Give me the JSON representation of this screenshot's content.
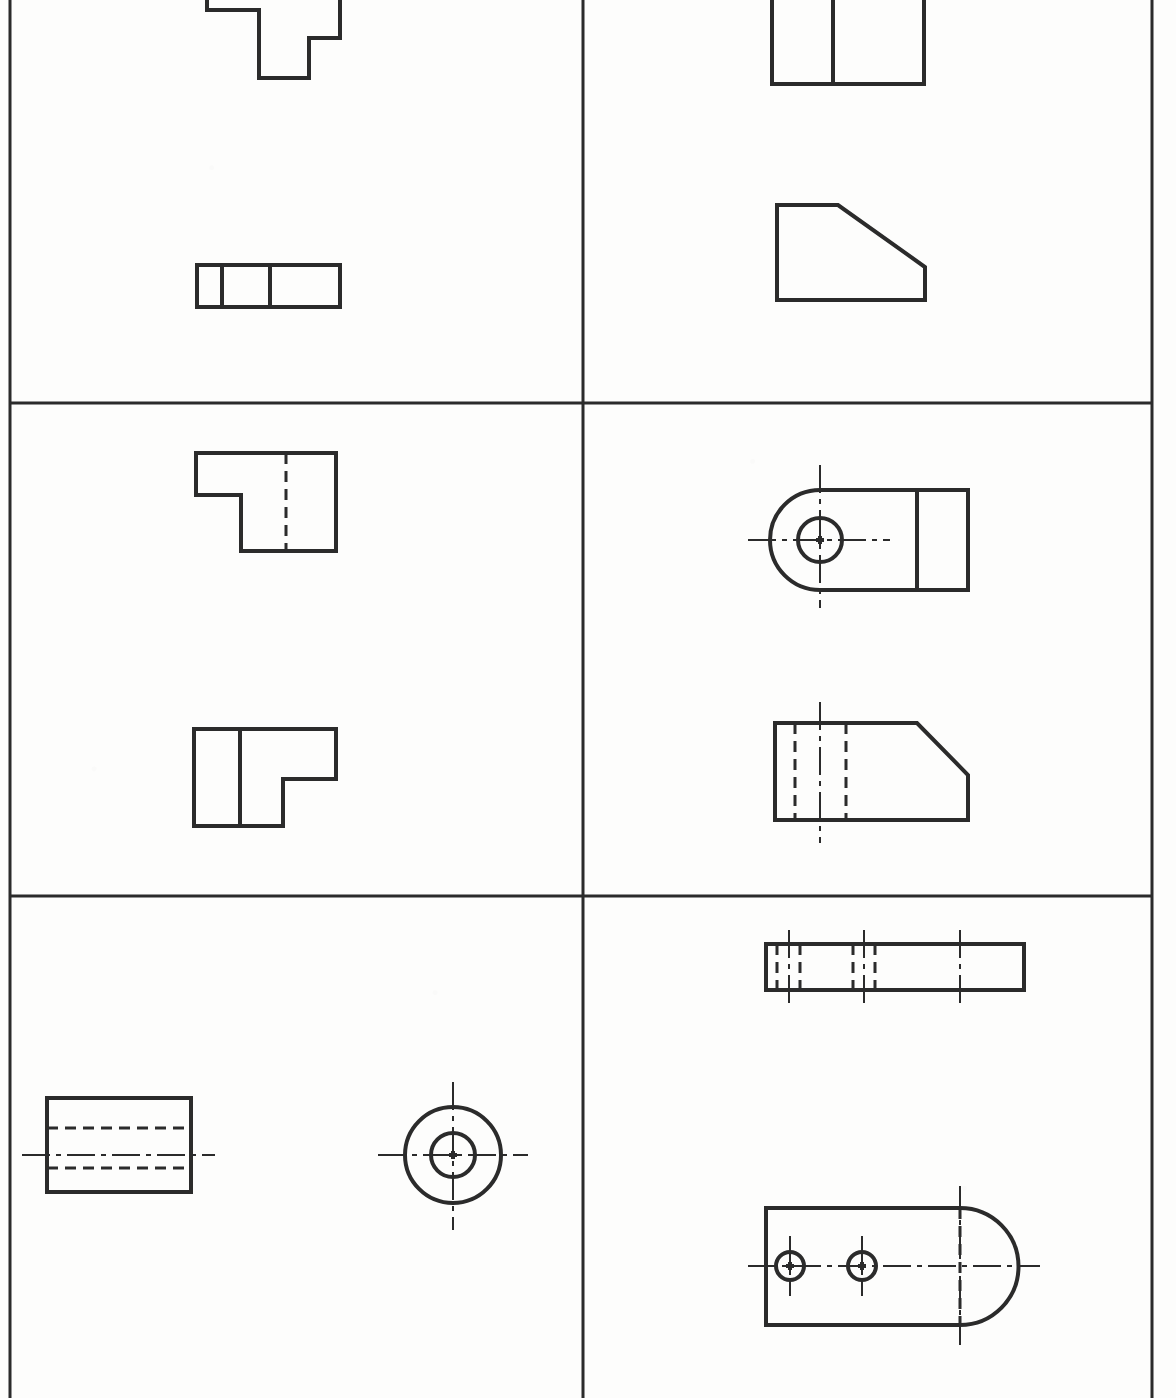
{
  "document": {
    "kind": "engineering-drawing-worksheet",
    "title": "Orthographic Projection Exercises",
    "page_width": 1176,
    "page_height": 1398,
    "background_color": "#fdfdfc",
    "line_color": "#2b2b2b",
    "border": {
      "left_x": 10,
      "right_x": 1152,
      "visible_edges": [
        "left",
        "right"
      ],
      "stroke_width": 3
    },
    "grid": {
      "columns": 2,
      "rows": 3,
      "vertical_divider_x": 583,
      "horizontal_divider_y": [
        403,
        896
      ],
      "stroke_width": 3
    },
    "line_styles": {
      "visible": {
        "name": "visible-object-line",
        "dash": "none",
        "width": 4
      },
      "hidden": {
        "name": "hidden-dashed-line",
        "dash": "11,7",
        "width": 3
      },
      "center": {
        "name": "center-line",
        "dash": "28,6,5,6",
        "width": 2
      }
    }
  },
  "cells": [
    {
      "id": "cell-top-left",
      "name": "exercise-1",
      "row": 1,
      "column": 1,
      "figures": [
        {
          "id": "fig-1a",
          "name": "stepped-t-block-front-view",
          "view": "front",
          "shape": "polyline-outline",
          "clipped_at_page_top": true,
          "points": "207,-40 207,10 259,10 259,78 309,78 309,38 340,38 340,-40",
          "style": "visible"
        },
        {
          "id": "fig-1b",
          "name": "three-compartment-rectangle-top-view",
          "view": "top",
          "shape": "rectangle-with-dividers",
          "x": 197,
          "y": 265,
          "width": 143,
          "height": 42,
          "divider_x": [
            222,
            270
          ],
          "style": "visible"
        }
      ]
    },
    {
      "id": "cell-top-right",
      "name": "exercise-2",
      "row": 1,
      "column": 2,
      "figures": [
        {
          "id": "fig-2a",
          "name": "two-compartment-rectangle-top-view",
          "view": "top",
          "shape": "rectangle-with-dividers",
          "x": 772,
          "y": -40,
          "width": 152,
          "height": 124,
          "divider_x": [
            833
          ],
          "style": "visible"
        },
        {
          "id": "fig-2b",
          "name": "chamfered-block-front-view",
          "view": "front",
          "shape": "polygon",
          "points": "777,205 838,205 925,267 925,300 777,300",
          "style": "visible"
        }
      ]
    },
    {
      "id": "cell-middle-left",
      "name": "exercise-3",
      "row": 2,
      "column": 1,
      "figures": [
        {
          "id": "fig-3a",
          "name": "l-notch-block-top-view",
          "view": "top",
          "shape": "polygon",
          "points": "196,453 336,453 336,551 241,551 241,495 196,495",
          "style": "visible",
          "hidden_lines": [
            {
              "name": "hidden-edge-vertical",
              "x1": 286,
              "y1": 453,
              "x2": 286,
              "y2": 551
            }
          ]
        },
        {
          "id": "fig-3b",
          "name": "l-step-block-front-view",
          "view": "front",
          "shape": "polygon",
          "points": "194,729 336,729 336,779 283,779 283,826 194,826",
          "style": "visible",
          "internal_lines": [
            {
              "name": "edge-line-vertical",
              "x1": 240,
              "y1": 729,
              "x2": 240,
              "y2": 826
            }
          ]
        }
      ]
    },
    {
      "id": "cell-middle-right",
      "name": "exercise-4",
      "row": 2,
      "column": 2,
      "figures": [
        {
          "id": "fig-4a",
          "name": "rounded-end-bracket-with-bore-top-view",
          "view": "top",
          "shape": "rounded-left-end-plate-with-hole",
          "body": {
            "x": 820,
            "y": 490,
            "right_x": 968,
            "top_y": 490,
            "bottom_y": 590
          },
          "arc": {
            "center_x": 820,
            "center_y": 540,
            "radius": 50
          },
          "hole": {
            "name": "bore-circle",
            "center_x": 820,
            "center_y": 540,
            "radius": 22
          },
          "divider_x": [
            917
          ],
          "center_lines": {
            "horizontal": {
              "x1": 748,
              "y1": 540,
              "x2": 890,
              "y2": 540
            },
            "vertical": {
              "x1": 820,
              "y1": 465,
              "x2": 820,
              "y2": 608
            }
          },
          "style": "visible"
        },
        {
          "id": "fig-4b",
          "name": "chamfered-block-with-hidden-bore-front-view",
          "view": "front",
          "shape": "polygon",
          "points": "775,723 917,723 968,775 968,820 775,820",
          "style": "visible",
          "hidden_lines": [
            {
              "name": "hidden-bore-left",
              "x1": 795,
              "y1": 723,
              "x2": 795,
              "y2": 820
            },
            {
              "name": "hidden-bore-right",
              "x1": 846,
              "y1": 723,
              "x2": 846,
              "y2": 820
            }
          ],
          "center_lines": {
            "vertical": {
              "x1": 820,
              "y1": 702,
              "x2": 820,
              "y2": 843
            }
          }
        }
      ]
    },
    {
      "id": "cell-bottom-left",
      "name": "exercise-5",
      "row": 3,
      "column": 1,
      "figures": [
        {
          "id": "fig-5a",
          "name": "cylinder-with-bore-front-view",
          "view": "front",
          "shape": "rectangle",
          "x": 47,
          "y": 1098,
          "width": 144,
          "height": 94,
          "style": "visible",
          "hidden_lines": [
            {
              "name": "hidden-bore-top",
              "x1": 47,
              "y1": 1128,
              "x2": 191,
              "y2": 1128
            },
            {
              "name": "hidden-bore-bottom",
              "x1": 47,
              "y1": 1168,
              "x2": 191,
              "y2": 1168
            }
          ],
          "center_lines": {
            "horizontal": {
              "x1": 22,
              "y1": 1155,
              "x2": 215,
              "y2": 1155
            }
          }
        },
        {
          "id": "fig-5b",
          "name": "concentric-circles-side-view",
          "view": "side",
          "shape": "concentric-circles",
          "center_x": 453,
          "center_y": 1155,
          "outer_radius": 48,
          "inner_radius": 22,
          "style": "visible",
          "center_lines": {
            "horizontal": {
              "x1": 378,
              "y1": 1155,
              "x2": 528,
              "y2": 1155
            },
            "vertical": {
              "x1": 453,
              "y1": 1082,
              "x2": 453,
              "y2": 1230
            }
          }
        }
      ]
    },
    {
      "id": "cell-bottom-right",
      "name": "exercise-6",
      "row": 3,
      "column": 2,
      "figures": [
        {
          "id": "fig-6a",
          "name": "long-bar-with-two-hidden-bores-front-view",
          "view": "front",
          "shape": "rectangle",
          "x": 766,
          "y": 944,
          "width": 258,
          "height": 46,
          "style": "visible",
          "hidden_lines": [
            {
              "name": "hidden-bore-1-left",
              "x1": 777,
              "y1": 944,
              "x2": 777,
              "y2": 990
            },
            {
              "name": "hidden-bore-1-right",
              "x1": 800,
              "y1": 944,
              "x2": 800,
              "y2": 990
            },
            {
              "name": "hidden-bore-2-left",
              "x1": 853,
              "y1": 944,
              "x2": 853,
              "y2": 990
            },
            {
              "name": "hidden-bore-2-right",
              "x1": 875,
              "y1": 944,
              "x2": 875,
              "y2": 990
            }
          ],
          "center_lines": {
            "vertical": [
              {
                "x1": 789,
                "y1": 930,
                "x2": 789,
                "y2": 1004
              },
              {
                "x1": 864,
                "y1": 930,
                "x2": 864,
                "y2": 1004
              },
              {
                "x1": 960,
                "y1": 930,
                "x2": 960,
                "y2": 1004
              }
            ]
          }
        },
        {
          "id": "fig-6b",
          "name": "rounded-end-plate-with-two-bores-top-view",
          "view": "top",
          "shape": "rounded-right-end-plate-with-holes",
          "body": {
            "left_x": 766,
            "top_y": 1208,
            "bottom_y": 1325,
            "right_x": 960
          },
          "arc": {
            "center_x": 960,
            "center_y": 1266,
            "radius": 58
          },
          "holes": [
            {
              "name": "bore-circle-left",
              "center_x": 790,
              "center_y": 1266,
              "radius": 14
            },
            {
              "name": "bore-circle-right",
              "center_x": 862,
              "center_y": 1266,
              "radius": 14
            }
          ],
          "center_lines": {
            "horizontal": {
              "x1": 748,
              "y1": 1266,
              "x2": 1040,
              "y2": 1266
            },
            "vertical": [
              {
                "x1": 790,
                "y1": 1236,
                "x2": 790,
                "y2": 1296
              },
              {
                "x1": 862,
                "y1": 1236,
                "x2": 862,
                "y2": 1296
              },
              {
                "x1": 960,
                "y1": 1186,
                "x2": 960,
                "y2": 1345
              }
            ]
          },
          "hidden_lines": [
            {
              "name": "hidden-tangent-line",
              "x1": 960,
              "y1": 1208,
              "x2": 960,
              "y2": 1325
            }
          ]
        }
      ]
    }
  ]
}
